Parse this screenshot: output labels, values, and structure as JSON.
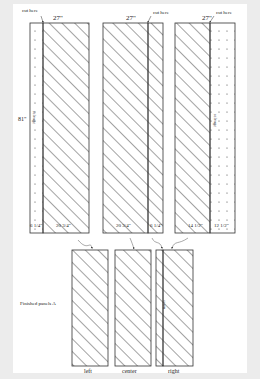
{
  "diagram": {
    "title": "",
    "top_panels": [
      {
        "id": "panel-1",
        "width_label": "27\"",
        "cut_label": "cut here",
        "height_label": "81\"",
        "selvage_label": "selvage",
        "segments": [
          {
            "label": "6 1/4\"",
            "fill": "dots"
          },
          {
            "label": "20 3/4\"",
            "fill": "hatch"
          }
        ]
      },
      {
        "id": "panel-2",
        "width_label": "27\"",
        "cut_label": "cut here",
        "segments": [
          {
            "label": "20 3/4\"",
            "fill": "hatch"
          },
          {
            "label": "6 1/4\"",
            "fill": "hatch"
          }
        ]
      },
      {
        "id": "panel-3",
        "width_label": "27\"",
        "cut_label": "cut here",
        "selvage_label": "selvage",
        "segments": [
          {
            "label": "14 1/2\"",
            "fill": "hatch"
          },
          {
            "label": "12 1/2\"",
            "fill": "dots"
          }
        ]
      }
    ],
    "finished_label": "Finished panels A",
    "finished_panels": [
      {
        "label": "left"
      },
      {
        "label": "center"
      },
      {
        "label": "right",
        "seam_label": "seam"
      }
    ]
  },
  "colors": {
    "background": "#ececec",
    "page": "#ffffff",
    "line": "#333333"
  }
}
